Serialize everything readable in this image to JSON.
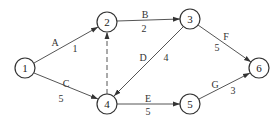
{
  "diagram": {
    "type": "activity-on-arrow network",
    "nodes": [
      {
        "id": "1",
        "label": "1",
        "x": 25,
        "y": 68
      },
      {
        "id": "2",
        "label": "2",
        "x": 107,
        "y": 22
      },
      {
        "id": "3",
        "label": "3",
        "x": 190,
        "y": 19
      },
      {
        "id": "4",
        "label": "4",
        "x": 107,
        "y": 104
      },
      {
        "id": "5",
        "label": "5",
        "x": 190,
        "y": 104
      },
      {
        "id": "6",
        "label": "6",
        "x": 259,
        "y": 68
      }
    ],
    "edges": [
      {
        "from": "1",
        "to": "2",
        "activity": "A",
        "duration": "1",
        "dashed": false
      },
      {
        "from": "1",
        "to": "4",
        "activity": "C",
        "duration": "5",
        "dashed": false
      },
      {
        "from": "2",
        "to": "3",
        "activity": "B",
        "duration": "2",
        "dashed": false
      },
      {
        "from": "3",
        "to": "4",
        "activity": "D",
        "duration": "4",
        "dashed": false
      },
      {
        "from": "4",
        "to": "2",
        "activity": "",
        "duration": "",
        "dashed": true
      },
      {
        "from": "4",
        "to": "5",
        "activity": "E",
        "duration": "5",
        "dashed": false
      },
      {
        "from": "3",
        "to": "6",
        "activity": "F",
        "duration": "5",
        "dashed": false
      },
      {
        "from": "5",
        "to": "6",
        "activity": "G",
        "duration": "3",
        "dashed": false
      }
    ],
    "labels": {
      "A": "A",
      "A_dur": "1",
      "B": "B",
      "B_dur": "2",
      "C": "C",
      "C_dur": "5",
      "D": "D",
      "D_dur": "4",
      "E": "E",
      "E_dur": "5",
      "F": "F",
      "F_dur": "5",
      "G": "G",
      "G_dur": "3"
    },
    "node_labels": {
      "n1": "1",
      "n2": "2",
      "n3": "3",
      "n4": "4",
      "n5": "5",
      "n6": "6"
    }
  }
}
